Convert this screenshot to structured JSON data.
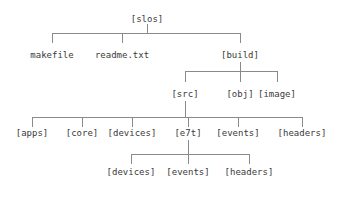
{
  "diagram": {
    "type": "tree",
    "text_color": "#3a3a3a",
    "line_color": "#8a8a8a",
    "background": "#ffffff",
    "nodes": [
      {
        "id": "slos",
        "label": "[slos]",
        "x": 147,
        "y": 14,
        "level": 0
      },
      {
        "id": "makefile",
        "label": "makefile",
        "x": 52,
        "y": 56,
        "level": 1
      },
      {
        "id": "readme",
        "label": "readme.txt",
        "x": 122,
        "y": 56,
        "level": 1
      },
      {
        "id": "build",
        "label": "[build]",
        "x": 240,
        "y": 56,
        "level": 1
      },
      {
        "id": "src",
        "label": "[src]",
        "x": 185,
        "y": 95,
        "level": 2
      },
      {
        "id": "obj",
        "label": "[obj]",
        "x": 240,
        "y": 95,
        "level": 2
      },
      {
        "id": "image",
        "label": "[image]",
        "x": 277,
        "y": 95,
        "level": 2
      },
      {
        "id": "apps",
        "label": "[apps]",
        "x": 32,
        "y": 134,
        "level": 3
      },
      {
        "id": "core",
        "label": "[core]",
        "x": 82,
        "y": 134,
        "level": 3
      },
      {
        "id": "devices",
        "label": "[devices]",
        "x": 132,
        "y": 134,
        "level": 3
      },
      {
        "id": "e7t",
        "label": "[e7t]",
        "x": 188,
        "y": 134,
        "level": 3
      },
      {
        "id": "events",
        "label": "[events]",
        "x": 238,
        "y": 134,
        "level": 3
      },
      {
        "id": "headers",
        "label": "[headers]",
        "x": 302,
        "y": 134,
        "level": 3
      },
      {
        "id": "e7t-devices",
        "label": "[devices]",
        "x": 131,
        "y": 173,
        "level": 4
      },
      {
        "id": "e7t-events",
        "label": "[events]",
        "x": 188,
        "y": 173,
        "level": 4
      },
      {
        "id": "e7t-headers",
        "label": "[headers]",
        "x": 249,
        "y": 173,
        "level": 4
      }
    ],
    "connectors": [
      {
        "id": "slos-stem",
        "from": "slos",
        "to": "bus-1"
      },
      {
        "id": "bus-1",
        "children": [
          "makefile",
          "readme",
          "build"
        ]
      },
      {
        "id": "build-stem",
        "from": "build",
        "to": "bus-2"
      },
      {
        "id": "bus-2",
        "children": [
          "src",
          "obj",
          "image"
        ]
      },
      {
        "id": "src-stem",
        "from": "src",
        "to": "bus-3"
      },
      {
        "id": "bus-3",
        "children": [
          "apps",
          "core",
          "devices",
          "e7t",
          "events",
          "headers"
        ]
      },
      {
        "id": "e7t-stem",
        "from": "e7t",
        "to": "bus-4"
      },
      {
        "id": "bus-4",
        "children": [
          "e7t-devices",
          "e7t-events",
          "e7t-headers"
        ]
      }
    ]
  }
}
